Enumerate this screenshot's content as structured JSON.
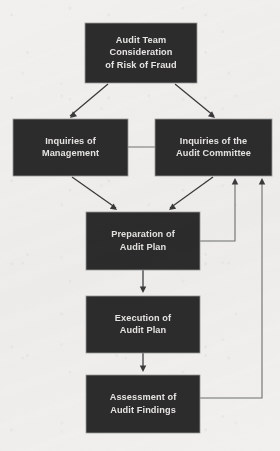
{
  "diagram": {
    "type": "flowchart",
    "background_color": "#f1f0ee",
    "node_fill_color": "#2c2c2c",
    "node_text_color": "#e6e5e3",
    "connector_color": "#3a3a3a",
    "feedback_connector_color": "#6f6f6f",
    "nodes": [
      {
        "id": "audit-team-consideration",
        "lines": [
          "Audit Team",
          "Consideration",
          "of Risk of Fraud"
        ],
        "x": 85,
        "y": 23,
        "w": 112,
        "h": 60
      },
      {
        "id": "inquiries-of-management",
        "lines": [
          "Inquiries of",
          "Management"
        ],
        "x": 13,
        "y": 119,
        "w": 115,
        "h": 57
      },
      {
        "id": "inquiries-of-audit-committee",
        "lines": [
          "Inquiries of the",
          "Audit Committee"
        ],
        "x": 155,
        "y": 119,
        "w": 117,
        "h": 57
      },
      {
        "id": "preparation-of-audit-plan",
        "lines": [
          "Preparation of",
          "Audit Plan"
        ],
        "x": 86,
        "y": 212,
        "w": 114,
        "h": 58
      },
      {
        "id": "execution-of-audit-plan",
        "lines": [
          "Execution of",
          "Audit Plan"
        ],
        "x": 86,
        "y": 296,
        "w": 114,
        "h": 57
      },
      {
        "id": "assessment-of-audit-findings",
        "lines": [
          "Assessment of",
          "Audit Findings"
        ],
        "x": 86,
        "y": 375,
        "w": 114,
        "h": 58
      }
    ],
    "edges": [
      {
        "id": "consideration-to-management",
        "from": "audit-team-consideration",
        "to": "inquiries-of-management",
        "kind": "diagonal-arrow",
        "path": "M 108 84 L 70 116",
        "arrow_at": [
          70,
          118
        ],
        "arrow_angle": 140
      },
      {
        "id": "consideration-to-audit-committee",
        "from": "audit-team-consideration",
        "to": "inquiries-of-audit-committee",
        "kind": "diagonal-arrow",
        "path": "M 175 84 L 214 116",
        "arrow_at": [
          215,
          118
        ],
        "arrow_angle": 40
      },
      {
        "id": "management-to-audit-committee-link",
        "from": "inquiries-of-management",
        "to": "inquiries-of-audit-committee",
        "kind": "plain-line",
        "path": "M 128 147 L 155 147"
      },
      {
        "id": "management-to-preparation",
        "from": "inquiries-of-management",
        "to": "preparation-of-audit-plan",
        "kind": "diagonal-arrow",
        "path": "M 72 177 L 116 208",
        "arrow_at": [
          117,
          210
        ],
        "arrow_angle": 36
      },
      {
        "id": "audit-committee-to-preparation",
        "from": "inquiries-of-audit-committee",
        "to": "preparation-of-audit-plan",
        "kind": "diagonal-arrow",
        "path": "M 213 177 L 170 208",
        "arrow_at": [
          169,
          210
        ],
        "arrow_angle": 144
      },
      {
        "id": "preparation-to-execution",
        "from": "preparation-of-audit-plan",
        "to": "execution-of-audit-plan",
        "kind": "straight-arrow",
        "path": "M 143 270 L 143 291",
        "arrow_at": [
          143,
          293
        ],
        "arrow_angle": 90
      },
      {
        "id": "execution-to-assessment",
        "from": "execution-of-audit-plan",
        "to": "assessment-of-audit-findings",
        "kind": "straight-arrow",
        "path": "M 143 353 L 143 370",
        "arrow_at": [
          143,
          372
        ],
        "arrow_angle": 90
      },
      {
        "id": "preparation-feedback-to-audit-committee",
        "from": "preparation-of-audit-plan",
        "to": "inquiries-of-audit-committee",
        "kind": "feedback-loop",
        "path": "M 200 241 L 235 241 L 235 181",
        "arrow_at": [
          235,
          178
        ],
        "arrow_angle": 270
      },
      {
        "id": "assessment-feedback-to-audit-committee",
        "from": "assessment-of-audit-findings",
        "to": "inquiries-of-audit-committee",
        "kind": "feedback-loop",
        "path": "M 200 398 L 262 398 L 262 181",
        "arrow_at": [
          262,
          178
        ],
        "arrow_angle": 270
      }
    ]
  }
}
